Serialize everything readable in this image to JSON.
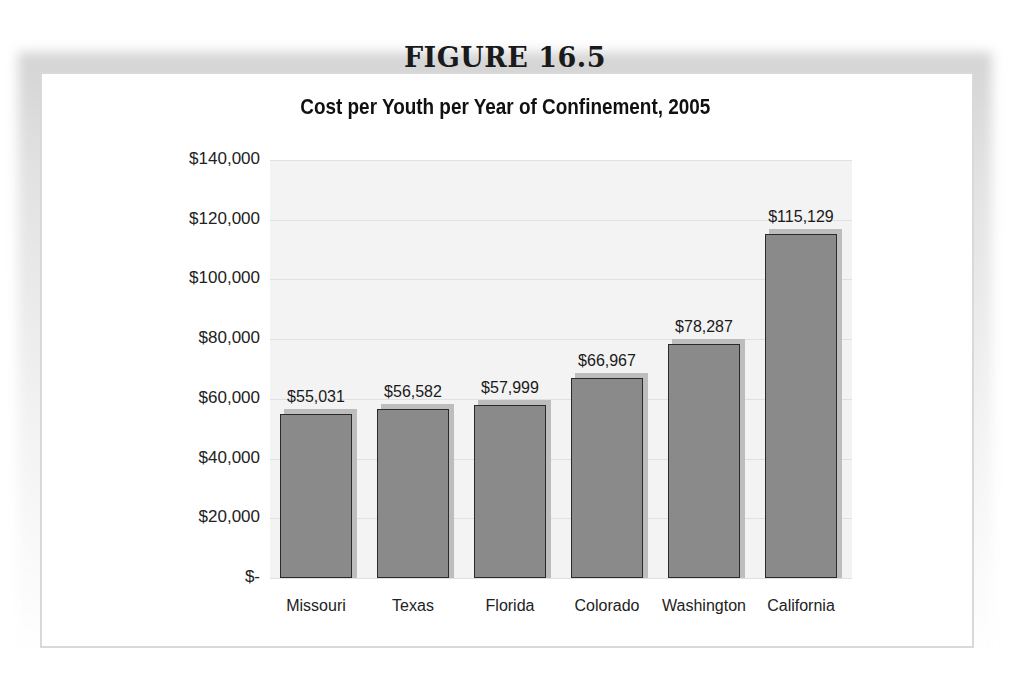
{
  "figure": {
    "label": "FIGURE 16.5"
  },
  "chart_data": {
    "type": "bar",
    "title": "Cost per Youth per Year of Confinement, 2005",
    "xlabel": "",
    "ylabel": "",
    "categories": [
      "Missouri",
      "Texas",
      "Florida",
      "Colorado",
      "Washington",
      "California"
    ],
    "values": [
      55031,
      56582,
      57999,
      66967,
      78287,
      115129
    ],
    "data_labels": [
      "$55,031",
      "$56,582",
      "$57,999",
      "$66,967",
      "$78,287",
      "$115,129"
    ],
    "ylim": [
      0,
      140000
    ],
    "yticks": [
      0,
      20000,
      40000,
      60000,
      80000,
      100000,
      120000,
      140000
    ],
    "ytick_labels": [
      "$-",
      "$20,000",
      "$40,000",
      "$60,000",
      "$80,000",
      "$100,000",
      "$120,000",
      "$140,000"
    ],
    "grid": true,
    "legend": null,
    "colors": {
      "bar": "#8a8a8a",
      "bar_border": "#2a2a2a",
      "bar_shadow": "#bdbdbd",
      "plot_bg": "#f3f3f3",
      "gridline": "#e0e0e0"
    }
  }
}
